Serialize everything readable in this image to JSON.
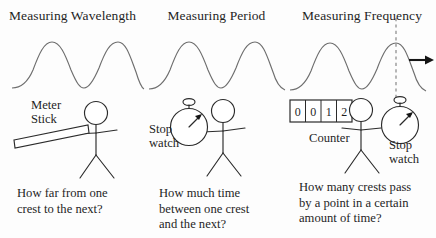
{
  "figure": {
    "background_color": "#fdfdfd",
    "ink_color": "#2b2b2b",
    "wave_color": "#6e6e6e"
  },
  "panels": [
    {
      "id": "wavelength",
      "title": "Measuring Wavelength",
      "tool_label": [
        "Meter",
        "Stick"
      ],
      "caption": [
        "How far from one",
        "crest to the next?"
      ],
      "icons": [
        "meter-stick-icon",
        "stick-figure-icon",
        "wave-icon"
      ]
    },
    {
      "id": "period",
      "title": "Measuring Period",
      "tool_label": [
        "Stop",
        "watch"
      ],
      "caption": [
        "How much time",
        "between one crest",
        "and the next?"
      ],
      "icons": [
        "stopwatch-icon",
        "stick-figure-icon",
        "wave-icon"
      ]
    },
    {
      "id": "frequency",
      "title": "Measuring Frequency",
      "tool_label": [
        "Stop",
        "watch"
      ],
      "counter_label": "Counter",
      "counter_digits": [
        "0",
        "0",
        "1",
        "2"
      ],
      "caption": [
        "How many crests pass",
        "by a point in a certain",
        "amount of time?"
      ],
      "icons": [
        "counter-icon",
        "stopwatch-icon",
        "stick-figure-icon",
        "wave-icon",
        "dashed-marker-line-icon",
        "direction-arrow-icon"
      ]
    }
  ]
}
